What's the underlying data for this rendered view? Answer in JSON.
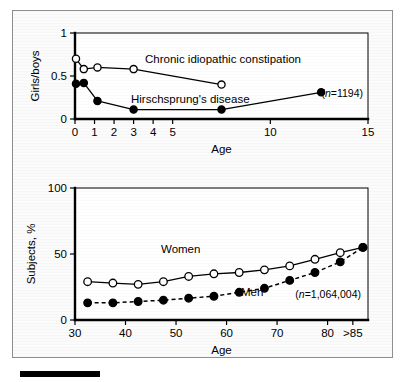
{
  "figure": {
    "background_color": "#fbfbfb",
    "border_color": "#8e8e8e",
    "scale_bar_color": "#000000"
  },
  "chart_data": [
    {
      "type": "line",
      "id": "top",
      "title": "",
      "xlabel": "Age",
      "ylabel": "Girls/boys",
      "xlim": [
        0,
        15
      ],
      "ylim": [
        0,
        1
      ],
      "xticks": [
        0,
        1,
        2,
        3,
        4,
        5,
        10,
        15
      ],
      "xtick_labels": [
        "0",
        "1",
        "2",
        "3",
        "4",
        "5",
        "10",
        "15"
      ],
      "yticks": [
        0,
        0.5,
        1
      ],
      "ytick_labels": [
        "0",
        "0.5",
        "1"
      ],
      "grid": false,
      "legend": "inline-annotation",
      "annotations": [
        {
          "text_prefix": "(",
          "text_italic": "n",
          "text_suffix": "=1194)",
          "full": "(n=1194)"
        }
      ],
      "series": [
        {
          "name": "Chronic idiopathic constipation",
          "marker": "open-circle",
          "line": "solid",
          "label_position": "above-right",
          "x": [
            0.05,
            0.45,
            1.15,
            3.0,
            7.5
          ],
          "y": [
            0.7,
            0.58,
            0.6,
            0.58,
            0.4
          ]
        },
        {
          "name": "Hirschsprung's disease",
          "marker": "filled-circle",
          "line": "solid",
          "label_position": "above-center",
          "x": [
            0.05,
            0.45,
            1.15,
            3.0,
            7.5,
            12.6
          ],
          "y": [
            0.41,
            0.42,
            0.21,
            0.11,
            0.11,
            0.31
          ]
        }
      ]
    },
    {
      "type": "line",
      "id": "bottom",
      "title": "",
      "xlabel": "Age",
      "ylabel": "Subjects, %",
      "xlim": [
        30,
        88
      ],
      "ylim": [
        0,
        100
      ],
      "xticks": [
        30,
        40,
        50,
        60,
        70,
        80,
        85
      ],
      "xtick_labels": [
        "30",
        "40",
        "50",
        "60",
        "70",
        "80",
        ">85"
      ],
      "yticks": [
        0,
        50,
        100
      ],
      "ytick_labels": [
        "0",
        "50",
        "100"
      ],
      "grid": false,
      "legend": "inline-annotation",
      "annotations": [
        {
          "text_prefix": "(",
          "text_italic": "n",
          "text_suffix": "=1,064,004)",
          "full": "(n=1,064,004)"
        }
      ],
      "series": [
        {
          "name": "Women",
          "marker": "open-circle",
          "line": "solid",
          "label_position": "above",
          "x": [
            32.5,
            37.5,
            42.5,
            47.5,
            52.5,
            57.5,
            62.5,
            67.5,
            72.5,
            77.5,
            82.5,
            87.0
          ],
          "y": [
            29,
            28,
            27,
            29,
            33,
            35,
            36,
            38,
            41,
            46,
            51,
            55
          ]
        },
        {
          "name": "Men",
          "marker": "filled-circle",
          "line": "dashed",
          "label_position": "below-right",
          "x": [
            32.5,
            37.5,
            42.5,
            47.5,
            52.5,
            57.5,
            62.5,
            67.5,
            72.5,
            77.5,
            82.5,
            87.0
          ],
          "y": [
            13,
            13,
            14,
            15,
            16.5,
            18,
            21,
            24,
            30,
            36,
            44,
            55
          ]
        }
      ]
    }
  ]
}
